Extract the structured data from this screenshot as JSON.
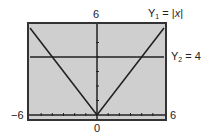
{
  "chart_data": {
    "type": "line",
    "title": "",
    "xlabel": "",
    "ylabel": "",
    "xlim": [
      -6,
      6
    ],
    "ylim": [
      0,
      6
    ],
    "xscale_ticks": 1,
    "yscale_ticks": 1,
    "grid": false,
    "axis_labels": {
      "xmin": "−6",
      "xmax": "6",
      "ymax": "6",
      "origin": "0"
    },
    "series": [
      {
        "name": "Y1 = |x|",
        "label_prefix": "Y",
        "label_sub": "1",
        "label_rest": " = |",
        "label_var": "x",
        "label_end": "|",
        "x": [
          -6,
          0,
          6
        ],
        "values": [
          6,
          0,
          6
        ]
      },
      {
        "name": "Y2 = 4",
        "label_prefix": "Y",
        "label_sub": "2",
        "label_rest": " = 4",
        "x": [
          -6,
          6
        ],
        "values": [
          4,
          4
        ]
      }
    ],
    "intersections": [
      [
        -4,
        4
      ],
      [
        4,
        4
      ]
    ],
    "colors": {
      "plot_background": "#cfcfcf",
      "frame": "#333333",
      "line": "#222222"
    }
  }
}
